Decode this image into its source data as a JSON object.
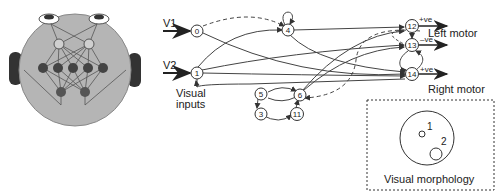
{
  "robot": {
    "body_color": "#b5b5b5",
    "wheel_color": "#333333",
    "hidden_node_color": "#444444",
    "input_node_color": "#cfcfcf"
  },
  "network": {
    "inputs": [
      {
        "label": "V1",
        "node": "0"
      },
      {
        "label": "V2",
        "node": "1"
      }
    ],
    "inputs_caption_line1": "Visual",
    "inputs_caption_line2": "inputs",
    "nodes": [
      "0",
      "1",
      "3",
      "4",
      "5",
      "6",
      "11",
      "12",
      "13",
      "14"
    ],
    "outputs": [
      {
        "node": "12",
        "sign": "+ve",
        "motor": "Left motor"
      },
      {
        "node": "13",
        "sign": "–ve",
        "motor": ""
      },
      {
        "node": "14",
        "sign": "+ve",
        "motor": "Right motor"
      }
    ],
    "left_motor_label": "Left motor",
    "right_motor_label": "Right motor"
  },
  "morphology": {
    "title": "Visual morphology",
    "receptors": [
      {
        "label": "1"
      },
      {
        "label": "2"
      }
    ]
  }
}
